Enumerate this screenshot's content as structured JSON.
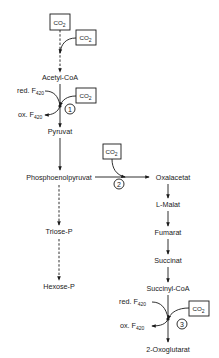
{
  "diagram": {
    "type": "metabolic-pathway",
    "compounds": {
      "acetyl_coa": "Acetyl-CoA",
      "pyruvat": "Pyruvat",
      "pep": "Phosphoenolpyruvat",
      "triose_p": "Triose-P",
      "hexose_p": "Hexose-P",
      "oxalacetat": "Oxalacetat",
      "l_malat": "L-Malat",
      "fumarat": "Fumarat",
      "succinat": "Succinat",
      "succinyl_coa": "Succinyl-CoA",
      "oxoglutarat": "2-Oxoglutarat"
    },
    "co2": {
      "base": "CO",
      "sub": "2"
    },
    "cofactors": {
      "red_prefix": "red. F",
      "ox_prefix": "ox. F",
      "sub": "420"
    },
    "enzymes": [
      "1",
      "2",
      "3"
    ],
    "edges": [
      {
        "from": "CO2",
        "to": "Acetyl-CoA",
        "style": "dashed"
      },
      {
        "from": "CO2",
        "to": "Acetyl-CoA",
        "style": "dashed",
        "side_input": true
      },
      {
        "from": "Acetyl-CoA",
        "to": "Pyruvat",
        "enzyme": "1",
        "inputs": [
          "CO2",
          "red. F420"
        ],
        "outputs": [
          "ox. F420"
        ]
      },
      {
        "from": "Pyruvat",
        "to": "Phosphoenolpyruvat",
        "style": "solid"
      },
      {
        "from": "Phosphoenolpyruvat",
        "to": "Triose-P",
        "style": "dashed"
      },
      {
        "from": "Triose-P",
        "to": "Hexose-P",
        "style": "dashed"
      },
      {
        "from": "Phosphoenolpyruvat",
        "to": "Oxalacetat",
        "enzyme": "2",
        "inputs": [
          "CO2"
        ]
      },
      {
        "from": "Oxalacetat",
        "to": "L-Malat"
      },
      {
        "from": "L-Malat",
        "to": "Fumarat"
      },
      {
        "from": "Fumarat",
        "to": "Succinat"
      },
      {
        "from": "Succinat",
        "to": "Succinyl-CoA"
      },
      {
        "from": "Succinyl-CoA",
        "to": "2-Oxoglutarat",
        "enzyme": "3",
        "inputs": [
          "CO2",
          "red. F420"
        ],
        "outputs": [
          "ox. F420"
        ]
      }
    ]
  }
}
